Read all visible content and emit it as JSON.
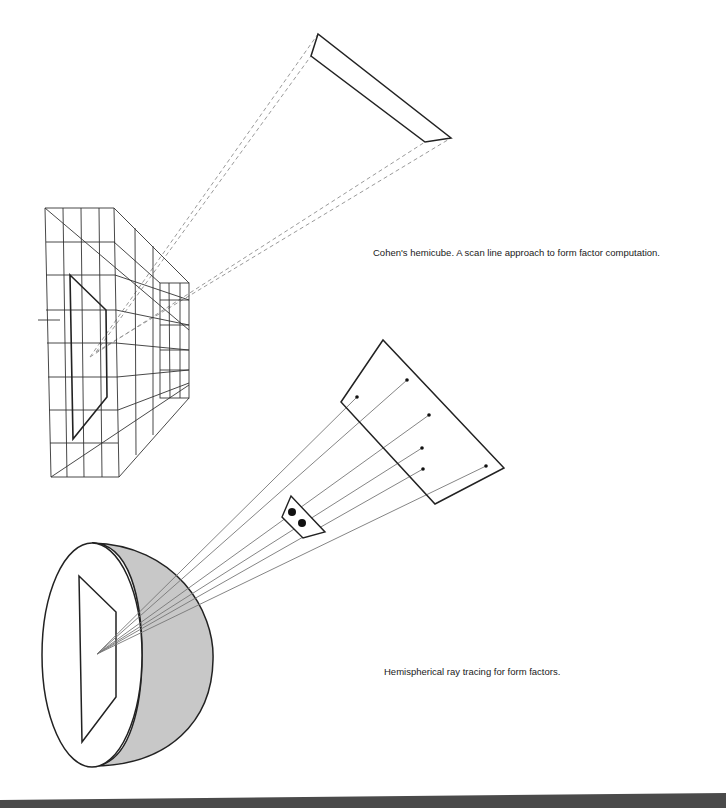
{
  "figure": {
    "captions": {
      "hemicube": "Cohen's hemicube. A scan line approach to form factor computation.",
      "hemisphere": "Hemispherical ray tracing for form factors."
    },
    "colors": {
      "line": "#222222",
      "grid": "#333333",
      "dashed": "#9a9a9a",
      "ray": "#777777",
      "shade": "#c8c8c8",
      "bottom_bar": "#4a4a4a"
    }
  }
}
